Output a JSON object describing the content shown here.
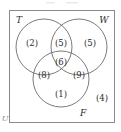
{
  "figure": {
    "type": "venn",
    "universe_label": "U",
    "frame": {
      "x": 9,
      "y": 10,
      "width": 105,
      "height": 112
    },
    "colors": {
      "background": "#ffffff",
      "frame_stroke": "#8a8a8a",
      "circle_stroke": "#6b6b6b",
      "text": "#2b2b2b",
      "faint_text": "#8e8e8e"
    }
  },
  "sets": [
    {
      "id": "T",
      "label": "T",
      "label_x": 19,
      "label_y": 20,
      "cx": 44,
      "cy": 47,
      "r": 28
    },
    {
      "id": "W",
      "label": "W",
      "label_x": 104,
      "label_y": 20,
      "cx": 79,
      "cy": 47,
      "r": 28
    },
    {
      "id": "F",
      "label": "F",
      "label_x": 83,
      "label_y": 113,
      "cx": 61,
      "cy": 79,
      "r": 28
    }
  ],
  "regions": [
    {
      "id": "T-only",
      "sets": "T",
      "count": "(2)",
      "x": 32,
      "y": 43
    },
    {
      "id": "T-and-W",
      "sets": "T,W",
      "count": "(5)",
      "x": 61,
      "y": 43
    },
    {
      "id": "W-only",
      "sets": "W",
      "count": "(5)",
      "x": 90,
      "y": 43
    },
    {
      "id": "T-W-F",
      "sets": "T,W,F",
      "count": "(6)",
      "x": 61,
      "y": 62
    },
    {
      "id": "T-and-F",
      "sets": "T,F",
      "count": "(8)",
      "x": 44,
      "y": 75
    },
    {
      "id": "W-and-F",
      "sets": "W,F",
      "count": "(9)",
      "x": 79,
      "y": 75
    },
    {
      "id": "F-only",
      "sets": "F",
      "count": "(1)",
      "x": 61,
      "y": 94
    },
    {
      "id": "outside",
      "sets": "",
      "count": "(4)",
      "x": 102,
      "y": 98
    }
  ],
  "chart_data": {
    "type": "venn",
    "set_names": [
      "T",
      "W",
      "F"
    ],
    "universe": "U",
    "region_values": {
      "T_only": 2,
      "W_only": 5,
      "F_only": 1,
      "T_and_W_only": 5,
      "T_and_F_only": 8,
      "W_and_F_only": 9,
      "T_and_W_and_F": 6,
      "outside_all": 4
    },
    "set_totals": {
      "T": 21,
      "W": 25,
      "F": 24
    },
    "universe_total": 40,
    "labels_shown_in_parentheses": true
  }
}
